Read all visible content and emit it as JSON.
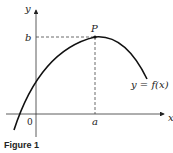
{
  "figure": {
    "caption": "Figure 1",
    "labels": {
      "y_axis": "y",
      "x_axis": "x",
      "origin": "0",
      "point": "P",
      "y_value": "b",
      "x_value": "a",
      "curve": "y = f(x)"
    },
    "colors": {
      "stroke": "#222222",
      "background": "#ffffff"
    }
  }
}
